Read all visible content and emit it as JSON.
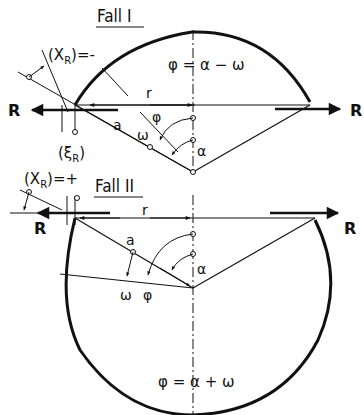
{
  "figure": {
    "case1": {
      "title": "Fall I",
      "formula": "φ = α − ω",
      "labels": {
        "xr": "(X",
        "xr_sub": "R",
        "xr_sign": ")=-",
        "xi": "(ξ",
        "xi_sub": "R",
        "xi_close": ")",
        "r": "r",
        "a": "a",
        "phi": "φ",
        "omega": "ω",
        "alpha": "α",
        "force_left": "R",
        "force_right": "R"
      }
    },
    "case2": {
      "title": "Fall II",
      "formula": "φ = α + ω",
      "labels": {
        "xr": "(X",
        "xr_sub": "R",
        "xr_sign": ")=+",
        "r": "r",
        "a": "a",
        "phi": "φ",
        "omega": "ω",
        "alpha": "α",
        "force_left": "R",
        "force_right": "R"
      }
    },
    "colors": {
      "ink": "#111111",
      "background": "#ffffff"
    }
  }
}
